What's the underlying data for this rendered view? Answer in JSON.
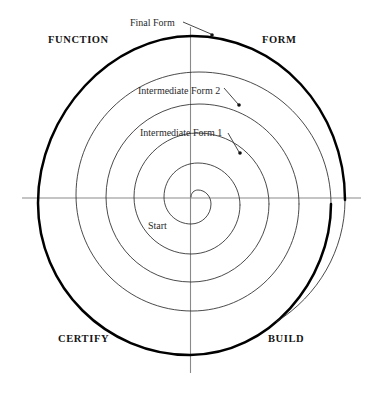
{
  "diagram": {
    "type": "spiral-quadrant-diagram",
    "center": {
      "x": 191,
      "y": 197
    },
    "axes": {
      "horizontal": {
        "x1": 22,
        "y1": 198,
        "x2": 361,
        "y2": 198
      },
      "vertical": {
        "x1": 190,
        "y1": 27,
        "x2": 190,
        "y2": 373
      },
      "color": "#808080",
      "width": 1
    },
    "quadrant_labels": [
      {
        "id": "function",
        "text": "FUNCTION",
        "quadrant": "top-left"
      },
      {
        "id": "form",
        "text": "FORM",
        "quadrant": "top-right"
      },
      {
        "id": "certify",
        "text": "CERTIFY",
        "quadrant": "bottom-left"
      },
      {
        "id": "build",
        "text": "BUILD",
        "quadrant": "bottom-right"
      }
    ],
    "callouts": [
      {
        "id": "final-form",
        "text": "Final Form",
        "leader": {
          "x1": 183,
          "y1": 22,
          "x2": 212,
          "y2": 35
        },
        "dot": {
          "x": 212,
          "y": 35
        }
      },
      {
        "id": "intermediate-form-2",
        "text": "Intermediate Form 2",
        "leader": {
          "x1": 224,
          "y1": 88,
          "x2": 239,
          "y2": 105
        },
        "dot": {
          "x": 239,
          "y": 105
        }
      },
      {
        "id": "intermediate-form-1",
        "text": "Intermediate Form 1",
        "leader": {
          "x1": 228,
          "y1": 133,
          "x2": 240,
          "y2": 153
        },
        "dot": {
          "x": 240,
          "y": 153
        }
      },
      {
        "id": "start",
        "text": "Start",
        "leader": null,
        "dot": null
      }
    ],
    "spiral": {
      "description": "Archimedean spiral of four turns growing from the centre, drawn clockwise starting at the centre point; the final outermost turn is drawn with a heavy stroke.",
      "turns": 4,
      "start_angle_deg": 90,
      "inner_radius": 8,
      "outer_radius": 155,
      "stroke_thin": "#2b2b2b",
      "stroke_thick": "#000000",
      "thin_width": 0.8,
      "thick_width": 2.4,
      "ring_radii_on_left_axis": [
        8,
        34,
        70,
        104,
        153
      ],
      "ring_radii_on_right_axis": [
        20,
        52,
        86,
        121,
        152
      ]
    },
    "colors": {
      "background": "#ffffff",
      "ink": "#151515",
      "axis": "#808080",
      "spiral_thin": "#2b2b2b",
      "spiral_thick": "#000000"
    }
  }
}
